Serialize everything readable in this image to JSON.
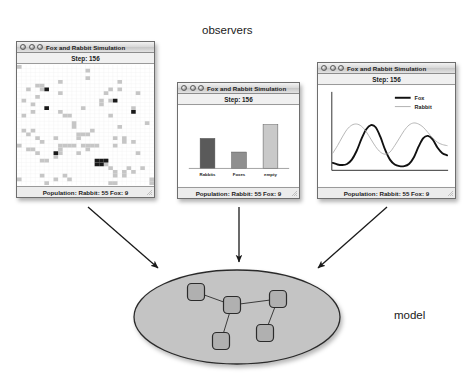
{
  "diagram": {
    "observers_label": "observers",
    "model_label": "model",
    "arrow_count": 3
  },
  "windows": [
    {
      "id": "grid",
      "title": "Fox and Rabbit Simulation",
      "step_label": "Step: 156",
      "status_label": "Population: Rabbit: 55 Fox: 9",
      "view_type": "grid",
      "traffic_lights": [
        "close-button",
        "minimize-button",
        "zoom-button"
      ]
    },
    {
      "id": "bars",
      "title": "Fox and Rabbit Simulation",
      "step_label": "Step: 156",
      "status_label": "Population: Rabbit: 55 Fox: 9",
      "view_type": "bar-chart",
      "traffic_lights": [
        "close-button",
        "minimize-button",
        "zoom-button"
      ]
    },
    {
      "id": "lines",
      "title": "Fox and Rabbit Simulation",
      "step_label": "Step: 156",
      "status_label": "Population: Rabbit: 55 Fox: 9",
      "view_type": "line-chart",
      "traffic_lights": [
        "close-button",
        "minimize-button",
        "zoom-button"
      ]
    }
  ],
  "chart_data": [
    {
      "type": "bar",
      "title": "Step: 156",
      "xlabel": "",
      "ylabel": "",
      "categories": [
        "Rabbits",
        "Foxes",
        "empty"
      ],
      "values": [
        55,
        30,
        80
      ],
      "ylim": [
        0,
        100
      ],
      "grid": false,
      "legend": "none",
      "colors": [
        "#5a5a5a",
        "#8f8f8f",
        "#c9c9c9"
      ]
    },
    {
      "type": "line",
      "title": "Step: 156",
      "xlabel": "",
      "ylabel": "",
      "ylim": [
        0,
        100
      ],
      "grid": false,
      "legend": "top-right",
      "series": [
        {
          "name": "Fox",
          "color": "#111111",
          "values": [
            12,
            9,
            8,
            10,
            18,
            34,
            56,
            74,
            82,
            78,
            60,
            36,
            18,
            9,
            6,
            6,
            10,
            22,
            42,
            58,
            62,
            55,
            40,
            30,
            26
          ]
        },
        {
          "name": "Rabbit",
          "color": "#a8a8a8",
          "values": [
            30,
            44,
            60,
            74,
            82,
            84,
            80,
            70,
            56,
            42,
            32,
            28,
            32,
            44,
            58,
            72,
            82,
            86,
            84,
            78,
            68,
            58,
            50,
            46,
            44
          ]
        }
      ]
    },
    {
      "type": "heatmap",
      "title": "Step: 156",
      "description": "Simulation field grid: light cells = rabbits, dark cells = foxes, white = empty",
      "grid_cols": 30,
      "grid_rows": 32,
      "legend": "none",
      "colors": {
        "rabbit": "#c6c6c6",
        "fox": "#1a1a1a",
        "empty": "#ffffff"
      }
    }
  ],
  "model_graph": {
    "ellipse_fill": "#c4c4c4",
    "ellipse_stroke": "#2b2b2b",
    "node_fill": "#b0b0b0",
    "node_stroke": "#2b2b2b",
    "nodes": [
      {
        "name": "node-top-left",
        "cx": 196,
        "cy": 292
      },
      {
        "name": "node-center",
        "cx": 232,
        "cy": 305
      },
      {
        "name": "node-top-right",
        "cx": 278,
        "cy": 299
      },
      {
        "name": "node-bottom-left",
        "cx": 221,
        "cy": 341
      },
      {
        "name": "node-bottom-right",
        "cx": 265,
        "cy": 333
      }
    ],
    "edges": [
      [
        0,
        1
      ],
      [
        1,
        2
      ],
      [
        1,
        3
      ],
      [
        2,
        4
      ]
    ]
  }
}
